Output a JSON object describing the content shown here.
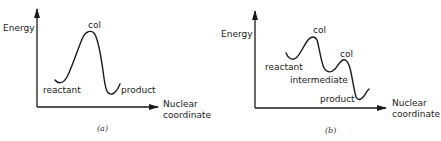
{
  "figure": {
    "panels": [
      {
        "id": "a",
        "caption": "(a)",
        "y_axis_label": "Energy",
        "x_axis_label_line1": "Nuclear",
        "x_axis_label_line2": "coordinate",
        "points": {
          "col": "col",
          "reactant": "reactant",
          "product": "product"
        }
      },
      {
        "id": "b",
        "caption": "(b)",
        "y_axis_label": "Energy",
        "x_axis_label_line1": "Nuclear",
        "x_axis_label_line2": "coordinate",
        "points": {
          "col1": "col",
          "col2": "col",
          "reactant": "reactant",
          "intermediate": "intermediate",
          "product": "product"
        }
      }
    ],
    "colors": {
      "ink": "#1a1a1a",
      "background": "#ffffff"
    }
  }
}
